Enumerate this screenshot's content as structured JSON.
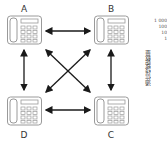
{
  "diagram": {
    "nodes": [
      {
        "id": "A",
        "label": "A"
      },
      {
        "id": "B",
        "label": "B"
      },
      {
        "id": "C",
        "label": "C"
      },
      {
        "id": "D",
        "label": "D"
      }
    ],
    "edges": [
      [
        "A",
        "B"
      ],
      [
        "A",
        "C"
      ],
      [
        "A",
        "D"
      ],
      [
        "B",
        "C"
      ],
      [
        "B",
        "D"
      ],
      [
        "C",
        "D"
      ]
    ],
    "edge_style": "double-headed arrow",
    "node_icon": "desk-telephone-icon"
  },
  "side_axis": {
    "ticks": [
      "1 000",
      "100",
      "10",
      "1"
    ],
    "label": "通信线路数量"
  },
  "colors": {
    "phone_outline": "#9a9a9a",
    "arrow": "#1a1a1a",
    "text": "#333333"
  }
}
